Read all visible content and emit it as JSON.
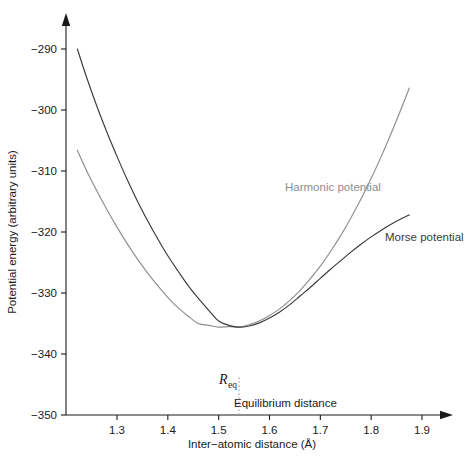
{
  "chart_data": {
    "type": "line",
    "title": "",
    "xlabel": "Inter−atomic distance (Å)",
    "ylabel": "Potential energy (arbitrary units)",
    "xlim": [
      1.22,
      1.93
    ],
    "ylim": [
      -350,
      -286
    ],
    "grid": false,
    "legend": "inline-labels",
    "xticks": [
      1.3,
      1.4,
      1.5,
      1.6,
      1.7,
      1.8,
      1.9
    ],
    "xtick_labels": [
      "1.3",
      "1.4",
      "1.5",
      "1.6",
      "1.7",
      "1.8",
      "1.9"
    ],
    "yticks": [
      -290,
      -300,
      -310,
      -320,
      -330,
      -340,
      -350
    ],
    "ytick_labels": [
      "−290",
      "−300",
      "−310",
      "−320",
      "−330",
      "−340",
      "−350"
    ],
    "annotations": [
      {
        "name": "equilibrium-marker",
        "text": "R_eq",
        "label_main": "R",
        "label_sub": "eq",
        "x": 1.54,
        "y": -345.0
      },
      {
        "name": "equilibrium-caption",
        "text": "Equilibrium distance",
        "x": 1.555,
        "y": -348.5
      }
    ],
    "series": [
      {
        "name": "Morse potential",
        "label": "Morse potential",
        "color": "#3a3a3a",
        "label_x": 1.795,
        "label_y": -324.0,
        "x": [
          1.222,
          1.24,
          1.26,
          1.28,
          1.3,
          1.32,
          1.34,
          1.36,
          1.38,
          1.4,
          1.42,
          1.44,
          1.46,
          1.48,
          1.5,
          1.52,
          1.54,
          1.56,
          1.58,
          1.6,
          1.62,
          1.64,
          1.66,
          1.68,
          1.7,
          1.72,
          1.74,
          1.76,
          1.78,
          1.8,
          1.82,
          1.84,
          1.86,
          1.875
        ],
        "y": [
          -290.0,
          -294.6,
          -299.3,
          -303.6,
          -307.6,
          -311.4,
          -314.9,
          -318.1,
          -321.1,
          -323.9,
          -326.4,
          -328.8,
          -330.9,
          -332.8,
          -334.6,
          -335.3,
          -335.6,
          -335.4,
          -334.9,
          -334.1,
          -333.1,
          -331.9,
          -330.5,
          -329.1,
          -327.6,
          -326.1,
          -324.7,
          -323.3,
          -322.0,
          -320.8,
          -319.7,
          -318.7,
          -317.8,
          -317.2
        ]
      },
      {
        "name": "Harmonic potential",
        "label": "Harmonic potential",
        "color": "#8d8d8d",
        "label_x": 1.662,
        "label_y": -316.0,
        "x": [
          1.222,
          1.24,
          1.26,
          1.28,
          1.3,
          1.32,
          1.34,
          1.36,
          1.38,
          1.4,
          1.42,
          1.44,
          1.46,
          1.48,
          1.5,
          1.52,
          1.54,
          1.56,
          1.58,
          1.6,
          1.62,
          1.64,
          1.66,
          1.68,
          1.7,
          1.72,
          1.74,
          1.76,
          1.78,
          1.8,
          1.82,
          1.84,
          1.86,
          1.875
        ],
        "y": [
          -306.6,
          -309.9,
          -313.2,
          -316.3,
          -319.2,
          -321.9,
          -324.4,
          -326.7,
          -328.8,
          -330.7,
          -332.4,
          -333.8,
          -335.0,
          -335.3,
          -335.6,
          -335.5,
          -335.6,
          -335.2,
          -334.6,
          -333.7,
          -332.6,
          -331.2,
          -329.6,
          -327.7,
          -325.6,
          -323.2,
          -320.6,
          -317.7,
          -314.6,
          -311.2,
          -307.6,
          -303.7,
          -299.6,
          -296.4
        ]
      }
    ]
  },
  "figure": {
    "axis_color": "#1a1a1a",
    "background": "#ffffff",
    "dotted_line_color": "#9a9a9a"
  }
}
